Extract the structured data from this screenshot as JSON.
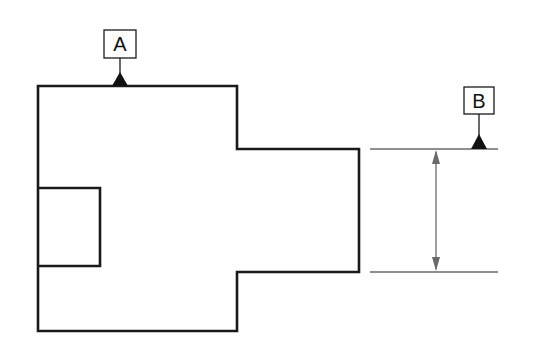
{
  "diagram": {
    "type": "engineering-drawing",
    "datums": [
      {
        "label": "A",
        "feature": "top edge of part"
      },
      {
        "label": "B",
        "feature": "upper extension line of dimension"
      }
    ],
    "dimension": {
      "type": "vertical",
      "value": ""
    },
    "colors": {
      "outline": "#1a1a1a",
      "dimension": "#6a6a6a",
      "background": "#ffffff"
    }
  }
}
